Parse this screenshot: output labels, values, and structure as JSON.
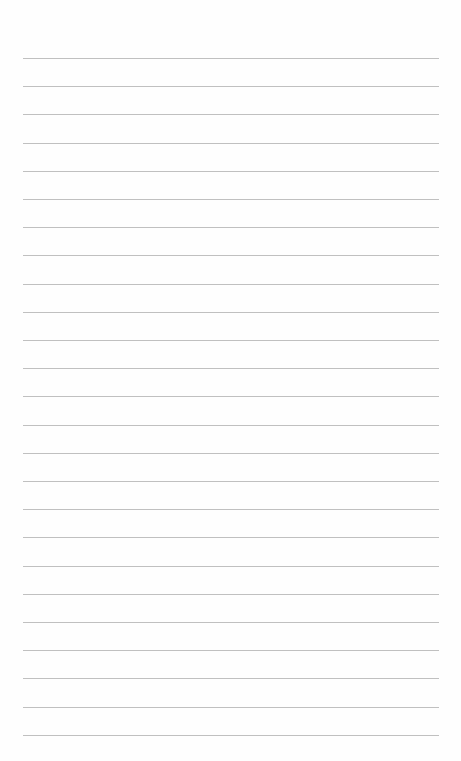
{
  "document": {
    "type": "lined-paper",
    "background_color": "#fefefe",
    "rule_color": "#b9b9b9",
    "rule_count": 25,
    "first_rule_y": 58,
    "rule_spacing": 28.2,
    "rule_left": 23,
    "rule_width": 416,
    "text_content": []
  }
}
